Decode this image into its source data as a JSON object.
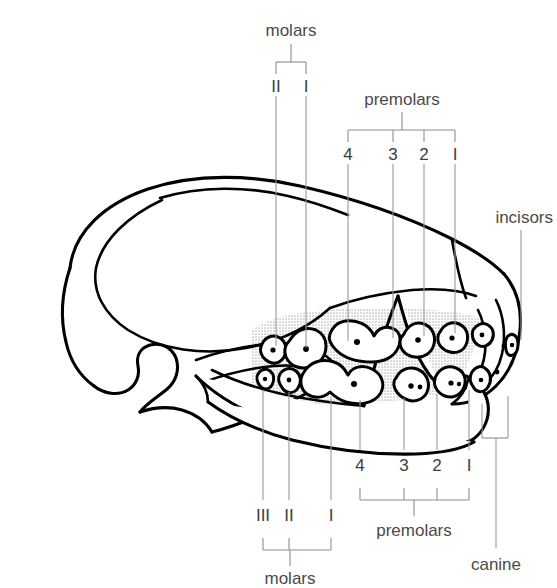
{
  "labels": {
    "molars_top": "molars",
    "premolars_top": "premolars",
    "incisors": "incisors",
    "molars_bottom": "molars",
    "premolars_bottom": "premolars",
    "canine": "canine"
  },
  "upper_molar_numbers": [
    "II",
    "I"
  ],
  "upper_premolar_numbers": [
    "4",
    "3",
    "2",
    "I"
  ],
  "lower_molar_numbers": [
    "III",
    "II",
    "I"
  ],
  "lower_premolar_numbers": [
    "4",
    "3",
    "2",
    "I"
  ],
  "colors": {
    "outline": "#000000",
    "leader": "#9a9a9a",
    "text": "#4a4a4a",
    "gum_shade": "#d8d8d8",
    "background": "#ffffff"
  }
}
